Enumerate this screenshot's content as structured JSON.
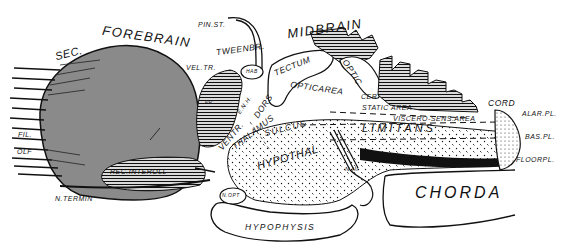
{
  "figure": {
    "colors": {
      "ink": "#111111",
      "forebrain_fill": "#8a8a8a",
      "background": "#ffffff"
    }
  },
  "labels": {
    "sec": "SEC.",
    "forebrain": "FOREBRAIN",
    "pin_st": "PIN.ST.",
    "tweenbr": "TWEENBR.",
    "midbrain": "MIDBRAIN",
    "vel_tr": "VEL.TR.",
    "hab": "HAB",
    "tectum": "TECTUM",
    "optic": "OPTIC",
    "cer": "CER",
    "optic_area": "OPTICAREA",
    "static_area": "STATIC AREA",
    "cord": "CORD",
    "alar_pl": "ALAR.PL.",
    "viscero_sens_area": "VISCERO-SENS.AREA",
    "limitans": "LIMITANS",
    "sulcus": "SULCUS",
    "bas_pl": "BAS.PL.",
    "floorpl": "FLOORPL.",
    "dors": "DORS",
    "thalamus": "THALAMUS",
    "ventr": "VENTR.",
    "enh": "E.N.H.",
    "hypothal": "HYPOTHAL",
    "n_iii": "N III",
    "chorda": "CHORDA",
    "hypophysis": "HYPOPHYSIS",
    "ncops": "N.OPT",
    "fil": "FIL.",
    "olf": "OLF",
    "rec_interoll": "REC.INTEROLL",
    "n_termin": "N.TERMIN",
    "pp": "PP"
  }
}
